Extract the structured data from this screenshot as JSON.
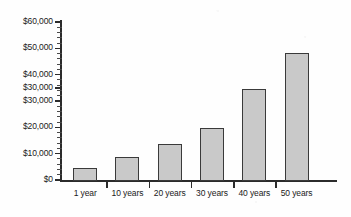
{
  "chart_data": {
    "type": "bar",
    "title": "",
    "subtitle": "",
    "xlabel": "",
    "ylabel": "",
    "categories": [
      "1 year",
      "10 years",
      "20 years",
      "30 years",
      "40 years",
      "50 years"
    ],
    "values": [
      5000,
      9000,
      14000,
      20000,
      35000,
      48500
    ],
    "value_unit": "USD",
    "ylim": [
      0,
      60000
    ],
    "y_tick_step": 10000,
    "y_tick_labels": [
      "$60,000",
      "$50,000",
      "$40,000",
      "$30,000",
      "$30,000",
      "$20,000",
      "$10,000",
      "$0"
    ],
    "y_tick_values": [
      60000,
      50000,
      40000,
      35000,
      30000,
      20000,
      10000,
      0
    ],
    "grid": false,
    "legend": null,
    "legend_position": "none",
    "series": [
      {
        "name": "Accumulated savings",
        "values": [
          5000,
          9000,
          14000,
          20000,
          35000,
          48500
        ]
      }
    ],
    "annotations": [],
    "note_y_axis_duplicate_label": "$30,000"
  },
  "style": {
    "bar_fill": "#c9c9c9",
    "bar_border": "#3a3a3a",
    "axis_color": "#2b2b2b",
    "text_color": "#1a1a1a",
    "background": "#fefefe"
  }
}
